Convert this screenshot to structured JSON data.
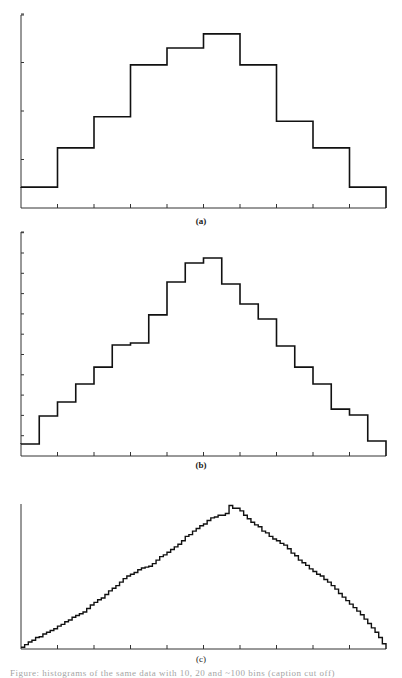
{
  "figure": {
    "panels": [
      "(a)",
      "(b)",
      "(c)"
    ],
    "caption_partial": "Figure: histograms of the same data with 10, 20 and ~100 bins (caption cut off)"
  },
  "colors": {
    "line": "#111111",
    "axis": "#333333",
    "background": "#ffffff"
  },
  "chart_data": [
    {
      "type": "bar",
      "style": "step-histogram",
      "title": "(a)",
      "bins": 10,
      "categories": [
        "1",
        "2",
        "3",
        "4",
        "5",
        "6",
        "7",
        "8",
        "9",
        "10"
      ],
      "values": [
        0.43,
        1.24,
        1.88,
        2.95,
        3.3,
        3.59,
        2.95,
        1.79,
        1.24,
        0.43
      ],
      "yticks": [
        0,
        1,
        2,
        3,
        4
      ],
      "xticks_count": 10,
      "ylim": [
        0,
        4
      ],
      "xlabel": "",
      "ylabel": "",
      "grid": false,
      "legend": null
    },
    {
      "type": "bar",
      "style": "step-histogram",
      "title": "(b)",
      "bins": 20,
      "categories": [
        "1",
        "2",
        "3",
        "4",
        "5",
        "6",
        "7",
        "8",
        "9",
        "10",
        "11",
        "12",
        "13",
        "14",
        "15",
        "16",
        "17",
        "18",
        "19",
        "20"
      ],
      "values": [
        0.59,
        1.97,
        2.66,
        3.55,
        4.38,
        5.47,
        5.57,
        6.95,
        8.57,
        9.51,
        9.75,
        8.47,
        7.49,
        6.75,
        5.42,
        4.38,
        3.55,
        2.31,
        2.02,
        0.74
      ],
      "yticks": [
        0,
        1,
        2,
        3,
        4,
        5,
        6,
        7,
        8,
        9,
        10,
        11
      ],
      "xticks_count": 10,
      "ylim": [
        0,
        11
      ],
      "xlabel": "",
      "ylabel": "",
      "grid": false,
      "legend": null
    },
    {
      "type": "bar",
      "style": "step-histogram",
      "title": "(c)",
      "bins": 100,
      "values": [
        2,
        5,
        8,
        10,
        13,
        14,
        17,
        19,
        21,
        23,
        26,
        28,
        31,
        33,
        36,
        38,
        40,
        42,
        46,
        50,
        53,
        56,
        58,
        62,
        66,
        69,
        72,
        76,
        80,
        83,
        85,
        87,
        90,
        92,
        93,
        94,
        97,
        101,
        105,
        107,
        110,
        113,
        116,
        119,
        123,
        128,
        130,
        134,
        137,
        140,
        142,
        146,
        149,
        150,
        152,
        152,
        154,
        163,
        160,
        160,
        157,
        152,
        148,
        144,
        141,
        139,
        134,
        132,
        128,
        125,
        123,
        120,
        118,
        114,
        109,
        106,
        101,
        98,
        95,
        91,
        88,
        85,
        83,
        79,
        76,
        72,
        68,
        63,
        59,
        55,
        51,
        47,
        43,
        39,
        34,
        29,
        24,
        19,
        13,
        6
      ],
      "xticks_count": 10,
      "ylim": [
        0,
        165
      ],
      "note": "values in relative units (pixel heights); y-axis has no tick marks",
      "xlabel": "",
      "ylabel": "",
      "grid": false,
      "legend": null
    }
  ]
}
